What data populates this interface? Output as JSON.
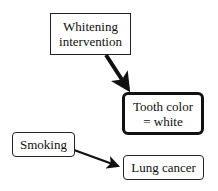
{
  "nodes": {
    "whitening": {
      "label": "Whitening intervention",
      "lines": [
        "Whitening",
        "intervention"
      ]
    },
    "tooth": {
      "label": "Tooth color = white",
      "lines": [
        "Tooth color",
        "= white"
      ]
    },
    "smoking": {
      "label": "Smoking"
    },
    "lung": {
      "label": "Lung cancer"
    }
  },
  "edges": [
    {
      "from": "whitening",
      "to": "tooth",
      "style": "thick"
    },
    {
      "from": "smoking",
      "to": "lung",
      "style": "normal"
    }
  ]
}
